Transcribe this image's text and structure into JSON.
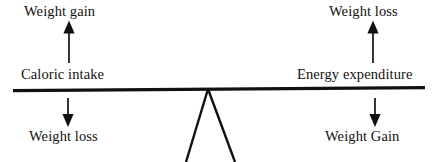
{
  "diagram": {
    "type": "balance-scale-diagram",
    "colors": {
      "ink": "#111111",
      "background": "#ffffff"
    },
    "labels": {
      "top_left": "Weight gain",
      "mid_left": "Caloric intake",
      "bottom_left": "Weight loss",
      "top_right": "Weight loss",
      "mid_right": "Energy expenditure",
      "bottom_right": "Weight Gain"
    },
    "arrows": {
      "left_up": "up-arrow",
      "left_down": "down-arrow",
      "right_up": "up-arrow",
      "right_down": "down-arrow"
    },
    "parts": {
      "beam": "balance-beam",
      "fulcrum": "triangular-fulcrum"
    }
  }
}
